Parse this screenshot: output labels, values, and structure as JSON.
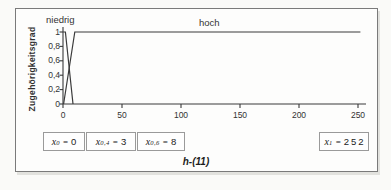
{
  "figure": {
    "caption": "h-(11)"
  },
  "chart_data": {
    "type": "line",
    "title": "",
    "xlabel": "",
    "ylabel": "Zugehörigkeitsgrad",
    "xlim": [
      0,
      256
    ],
    "ylim": [
      0,
      1
    ],
    "grid": false,
    "legend_position": "none",
    "line_color": "#3a3a3a",
    "x_ticks": [
      0,
      50,
      100,
      150,
      200,
      250
    ],
    "x_tick_labels": [
      "0",
      "50",
      "100",
      "150",
      "200",
      "250"
    ],
    "y_ticks": [
      0,
      0.2,
      0.4,
      0.6,
      0.8,
      1
    ],
    "y_tick_labels": [
      "0",
      "0,2",
      "0,4",
      "0,6",
      "0,8",
      "1"
    ],
    "curve_labels": [
      {
        "text": "niedrig"
      },
      {
        "text": "hoch"
      }
    ],
    "series": [
      {
        "name": "niedrig",
        "points": [
          [
            0,
            1
          ],
          [
            2,
            1
          ],
          [
            8.5,
            0
          ]
        ]
      },
      {
        "name": "hoch",
        "points": [
          [
            0.5,
            0
          ],
          [
            10,
            1
          ],
          [
            252,
            1
          ]
        ]
      }
    ]
  },
  "annotations": {
    "var": "x",
    "equals": "=",
    "boxes": [
      {
        "sub": "0",
        "value": "0"
      },
      {
        "sub": "0,4",
        "value": "3"
      },
      {
        "sub": "0,6",
        "value": "8"
      },
      {
        "sub": "1",
        "value": "252"
      }
    ]
  }
}
